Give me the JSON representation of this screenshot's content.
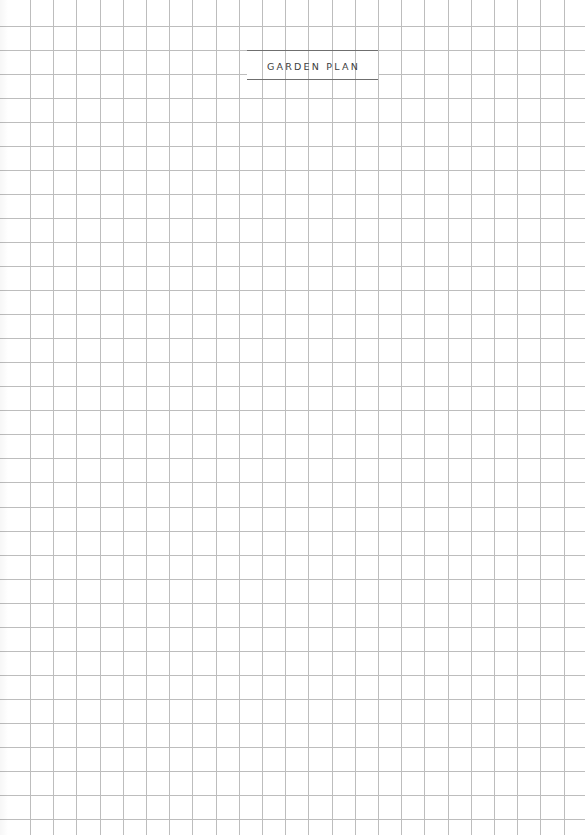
{
  "page": {
    "title": "GARDEN PLAN",
    "background_color": "#ffffff"
  },
  "grid": {
    "line_color": "#bdbdbd",
    "vertical": {
      "start_x": 30,
      "spacing": 23.2,
      "count": 24
    },
    "horizontal": {
      "start_y": 25.5,
      "spacing": 24.05,
      "count": 34
    },
    "title_gap": {
      "x1": 247,
      "x2": 378,
      "y1": 50,
      "y2": 80
    }
  },
  "title_box": {
    "rule_color": "#6f6f6f",
    "text_color": "#3d3d3d"
  }
}
